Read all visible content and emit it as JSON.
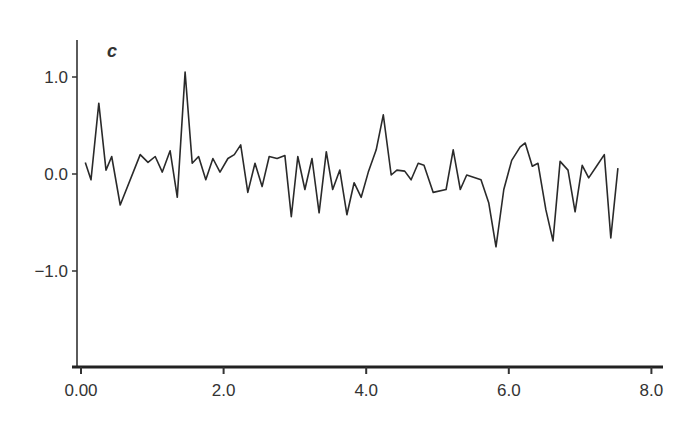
{
  "chart_data": {
    "type": "line",
    "title": "",
    "panel_label": "c",
    "xlabel": "",
    "ylabel": "",
    "xlim": [
      0,
      8.2
    ],
    "ylim": [
      -2.0,
      1.4
    ],
    "grid": false,
    "legend": null,
    "x_ticks": [
      {
        "value": 0,
        "label": "0.00"
      },
      {
        "value": 2,
        "label": "2.0"
      },
      {
        "value": 4,
        "label": "4.0"
      },
      {
        "value": 6,
        "label": "6.0"
      },
      {
        "value": 8,
        "label": "8.0"
      }
    ],
    "y_ticks": [
      {
        "value": 1,
        "label": "1.0"
      },
      {
        "value": 0,
        "label": "0.0"
      },
      {
        "value": -1,
        "label": "−1.0"
      }
    ],
    "series": [
      {
        "name": "c",
        "color": "#2a2a2a",
        "x": [
          0.06,
          0.14,
          0.25,
          0.35,
          0.43,
          0.55,
          0.83,
          0.94,
          1.04,
          1.14,
          1.25,
          1.35,
          1.46,
          1.56,
          1.65,
          1.75,
          1.85,
          1.95,
          2.06,
          2.15,
          2.24,
          2.34,
          2.44,
          2.54,
          2.64,
          2.75,
          2.86,
          2.95,
          3.04,
          3.14,
          3.24,
          3.34,
          3.44,
          3.53,
          3.63,
          3.73,
          3.83,
          3.93,
          4.03,
          4.14,
          4.24,
          4.35,
          4.43,
          4.54,
          4.63,
          4.73,
          4.81,
          4.94,
          5.12,
          5.22,
          5.32,
          5.41,
          5.61,
          5.72,
          5.82,
          5.93,
          6.04,
          6.16,
          6.23,
          6.33,
          6.41,
          6.52,
          6.62,
          6.72,
          6.83,
          6.93,
          7.03,
          7.12,
          7.24,
          7.34,
          7.43,
          7.53
        ],
        "values": [
          0.12,
          -0.06,
          0.73,
          0.04,
          0.18,
          -0.32,
          0.2,
          0.12,
          0.18,
          0.02,
          0.24,
          -0.24,
          1.05,
          0.11,
          0.18,
          -0.06,
          0.16,
          0.02,
          0.16,
          0.2,
          0.3,
          -0.19,
          0.11,
          -0.13,
          0.18,
          0.16,
          0.19,
          -0.44,
          0.18,
          -0.16,
          0.16,
          -0.4,
          0.23,
          -0.16,
          0.04,
          -0.42,
          -0.09,
          -0.24,
          0.02,
          0.25,
          0.61,
          -0.01,
          0.04,
          0.03,
          -0.06,
          0.11,
          0.09,
          -0.19,
          -0.16,
          0.25,
          -0.16,
          -0.01,
          -0.06,
          -0.3,
          -0.75,
          -0.16,
          0.14,
          0.28,
          0.32,
          0.08,
          0.11,
          -0.37,
          -0.69,
          0.13,
          0.04,
          -0.39,
          0.09,
          -0.04,
          0.09,
          0.2,
          -0.66,
          0.06
        ]
      }
    ]
  }
}
